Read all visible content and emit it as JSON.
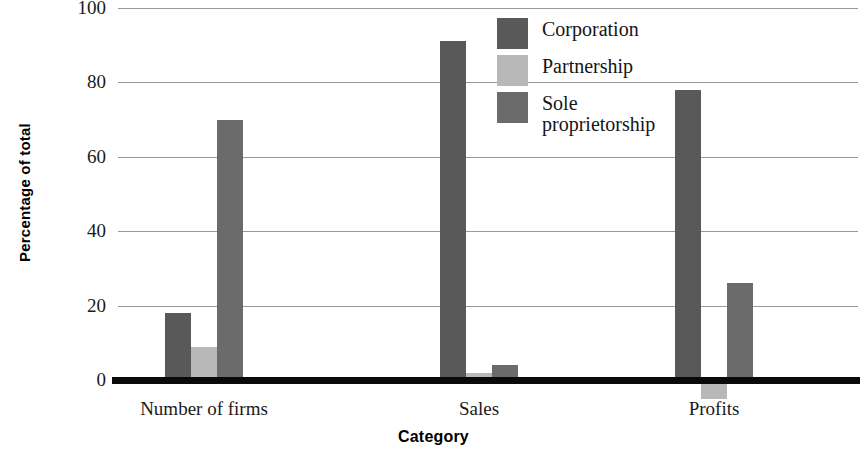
{
  "chart_data": {
    "type": "bar",
    "title": "",
    "xlabel": "Category",
    "ylabel": "Percentage of total",
    "categories": [
      "Number of firms",
      "Sales",
      "Profits"
    ],
    "series": [
      {
        "name": "Corporation",
        "color": "#595959",
        "values": [
          18,
          91,
          78
        ]
      },
      {
        "name": "Partnership",
        "color": "#b8b8b8",
        "values": [
          9,
          2,
          -2
        ]
      },
      {
        "name": "Sole proprietorship",
        "color": "#6b6b6b",
        "values": [
          70,
          4,
          26
        ]
      }
    ],
    "ylim": [
      0,
      100
    ],
    "yticks": [
      100,
      80,
      60,
      40,
      20,
      0
    ],
    "ytick_labels": [
      "100",
      "80",
      "60",
      "40",
      "20",
      "0"
    ],
    "grid": true,
    "legend_position": "top-right"
  },
  "axis": {
    "y_title": "Percentage of total",
    "x_title": "Category"
  }
}
